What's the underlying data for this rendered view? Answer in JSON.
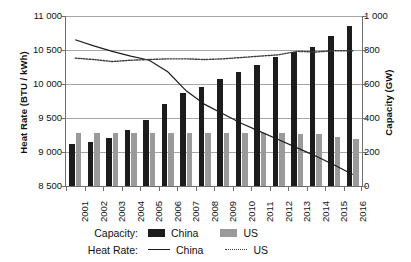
{
  "chart_data": {
    "type": "bar",
    "title": "",
    "subtitle": "",
    "xlabel": "",
    "ylabel": "Heat Rate (BTU / kWh)",
    "y2label": "Capacity (GW)",
    "grid": true,
    "legend_position": "bottom",
    "categories": [
      "2001",
      "2002",
      "2003",
      "2004",
      "2005",
      "2006",
      "2007",
      "2008",
      "2009",
      "2010",
      "2011",
      "2012",
      "2013",
      "2014",
      "2015",
      "2016"
    ],
    "ylim": [
      8500,
      11000
    ],
    "yticks": [
      "8 500",
      "9 000",
      "9 500",
      "10 000",
      "10 500",
      "11 000"
    ],
    "ytick_values": [
      8500,
      9000,
      9500,
      10000,
      10500,
      11000
    ],
    "y2lim": [
      0,
      1000
    ],
    "y2ticks": [
      "0",
      "200",
      "400",
      "600",
      "800",
      "1 000"
    ],
    "y2tick_values": [
      0,
      200,
      400,
      600,
      800,
      1000
    ],
    "series": [
      {
        "name": "Capacity: China",
        "kind": "bar",
        "axis": "right",
        "unit": "GW",
        "color": "#1c1c1c",
        "values": [
          247,
          258,
          285,
          330,
          390,
          480,
          545,
          585,
          630,
          670,
          710,
          760,
          790,
          820,
          880,
          940
        ]
      },
      {
        "name": "Capacity: US",
        "kind": "bar",
        "axis": "right",
        "unit": "GW",
        "color": "#9a9a9a",
        "values": [
          312,
          312,
          312,
          310,
          312,
          312,
          312,
          312,
          312,
          312,
          312,
          310,
          308,
          305,
          290,
          275
        ]
      },
      {
        "name": "Heat Rate: China",
        "kind": "line",
        "style": "solid",
        "axis": "left",
        "unit": "BTU / kWh",
        "color": "#1c1c1c",
        "values": [
          10650,
          10560,
          10480,
          10410,
          10350,
          10180,
          9900,
          9700,
          9560,
          9420,
          9300,
          9180,
          9060,
          8940,
          8810,
          8670
        ]
      },
      {
        "name": "Heat Rate: US",
        "kind": "line",
        "style": "dotted",
        "axis": "left",
        "unit": "BTU / kWh",
        "color": "#3a3a3a",
        "values": [
          10380,
          10360,
          10330,
          10350,
          10360,
          10370,
          10370,
          10360,
          10370,
          10390,
          10410,
          10430,
          10480,
          10470,
          10490,
          10490
        ]
      }
    ]
  },
  "axes": {
    "left_title": "Heat Rate (BTU / kWh)",
    "right_title": "Capacity (GW)"
  },
  "legend": {
    "capacity_heading": "Capacity:",
    "heatrate_heading": "Heat Rate:",
    "capacity_china": "China",
    "capacity_us": "US",
    "heatrate_china": "China",
    "heatrate_us": "US"
  }
}
